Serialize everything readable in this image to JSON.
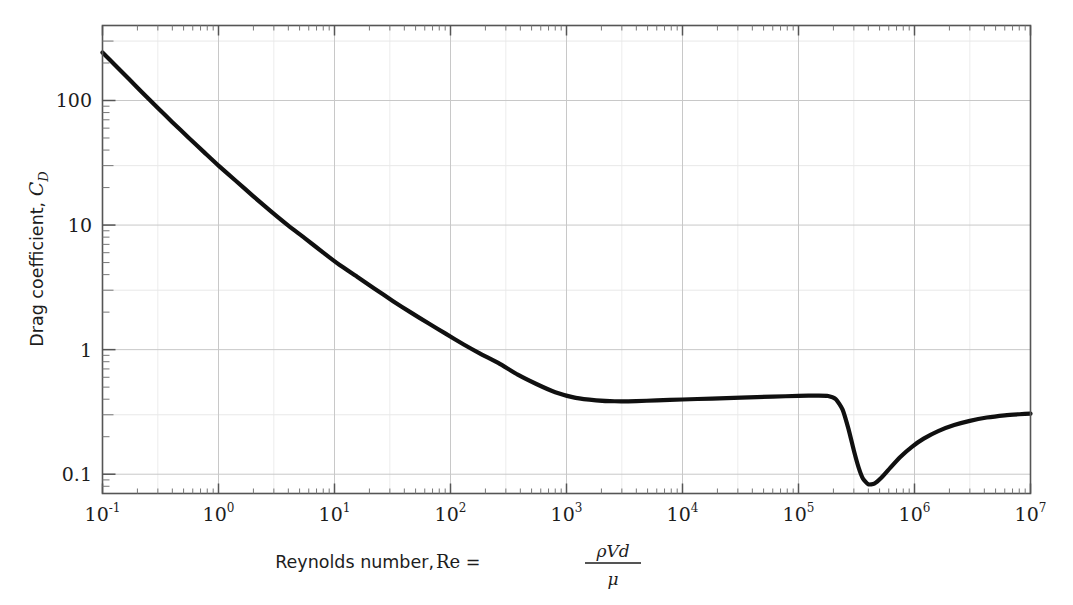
{
  "chart_data": {
    "type": "line",
    "title": "",
    "xlabel": "Reynolds number, Re = ρVd/μ",
    "xlabel_parts": {
      "prefix": "Reynolds number, ",
      "symbol": "Re",
      "equals": " = ",
      "numerator": "ρVd",
      "denominator": "μ"
    },
    "ylabel": "Drag coefficient, C_D",
    "ylabel_parts": {
      "prefix": "Drag coefficient, ",
      "symbol": "C",
      "subscript": "D"
    },
    "xscale": "log",
    "yscale": "log",
    "xlim": [
      0.1,
      10000000
    ],
    "ylim": [
      0.07,
      400
    ],
    "xticks": [
      0.1,
      1,
      10,
      100,
      1000,
      10000,
      100000,
      1000000,
      10000000
    ],
    "xticklabels": [
      "10⁻¹",
      "10⁰",
      "10¹",
      "10²",
      "10³",
      "10⁴",
      "10⁵",
      "10⁶",
      "10⁷"
    ],
    "xtick_exponents": [
      "-1",
      "0",
      "1",
      "2",
      "3",
      "4",
      "5",
      "6",
      "7"
    ],
    "xtick_mantissa": "10",
    "yticks": [
      0.1,
      1,
      10,
      100
    ],
    "yticklabels": [
      "0.1",
      "1",
      "10",
      "100"
    ],
    "grid": true,
    "grid_color": "#dcdcdc",
    "grid_major_color": "#c8c8c8",
    "frame_color": "#4d4d4d",
    "line_color": "#101010",
    "line_width": 4.2,
    "legend": null,
    "series": [
      {
        "name": "Sphere drag coefficient",
        "points": [
          [
            0.1,
            243.0
          ],
          [
            0.13,
            190.0
          ],
          [
            0.17,
            148.0
          ],
          [
            0.22,
            116.0
          ],
          [
            0.3,
            87.0
          ],
          [
            0.4,
            67.0
          ],
          [
            0.55,
            50.5
          ],
          [
            0.75,
            38.5
          ],
          [
            1.0,
            30.0
          ],
          [
            1.4,
            22.8
          ],
          [
            2.0,
            17.0
          ],
          [
            2.8,
            13.0
          ],
          [
            4.0,
            9.9
          ],
          [
            5.5,
            7.9
          ],
          [
            8.0,
            6.0
          ],
          [
            11.0,
            4.8
          ],
          [
            16.0,
            3.8
          ],
          [
            22.0,
            3.1
          ],
          [
            32.0,
            2.45
          ],
          [
            45.0,
            2.0
          ],
          [
            65.0,
            1.62
          ],
          [
            90.0,
            1.35
          ],
          [
            130.0,
            1.1
          ],
          [
            180.0,
            0.93
          ],
          [
            260.0,
            0.78
          ],
          [
            380.0,
            0.63
          ],
          [
            550.0,
            0.53
          ],
          [
            800.0,
            0.455
          ],
          [
            1200.0,
            0.41
          ],
          [
            1800.0,
            0.392
          ],
          [
            2600.0,
            0.385
          ],
          [
            4000.0,
            0.386
          ],
          [
            6000.0,
            0.392
          ],
          [
            10000.0,
            0.398
          ],
          [
            18000.0,
            0.405
          ],
          [
            32000.0,
            0.412
          ],
          [
            60000.0,
            0.42
          ],
          [
            100000.0,
            0.425
          ],
          [
            150000.0,
            0.428
          ],
          [
            180000.0,
            0.425
          ],
          [
            210000.0,
            0.4
          ],
          [
            240000.0,
            0.33
          ],
          [
            270000.0,
            0.23
          ],
          [
            300000.0,
            0.155
          ],
          [
            330000.0,
            0.113
          ],
          [
            360000.0,
            0.092
          ],
          [
            400000.0,
            0.083
          ],
          [
            450000.0,
            0.084
          ],
          [
            520000.0,
            0.094
          ],
          [
            620000.0,
            0.113
          ],
          [
            750000.0,
            0.137
          ],
          [
            950000.0,
            0.166
          ],
          [
            1200000.0,
            0.193
          ],
          [
            1600000.0,
            0.222
          ],
          [
            2200000.0,
            0.248
          ],
          [
            3000000.0,
            0.268
          ],
          [
            4200000.0,
            0.285
          ],
          [
            6000000.0,
            0.297
          ],
          [
            8000000.0,
            0.303
          ],
          [
            10000000.0,
            0.306
          ]
        ]
      }
    ],
    "annotations": [],
    "regions": {
      "stokes_law": "CD = 24/Re for Re < 1",
      "newton_plateau": "CD ≈ 0.4 for 10³ < Re < 2×10⁵",
      "drag_crisis": "sharp drop near Re ≈ 3×10⁵, minimum CD ≈ 0.083 near Re ≈ 4×10⁵"
    }
  }
}
